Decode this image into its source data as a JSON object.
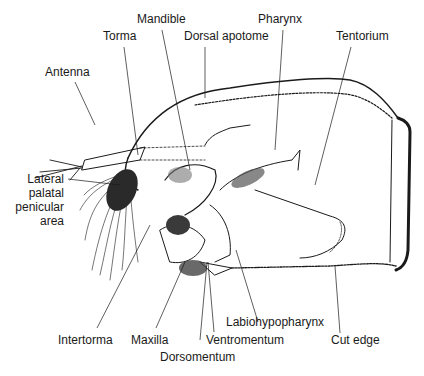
{
  "figure": {
    "ink_color": "#1a1a1a",
    "background": "#ffffff"
  },
  "labels": {
    "mandible": "Mandible",
    "pharynx": "Pharynx",
    "torma": "Torma",
    "dorsal_apotome": "Dorsal apotome",
    "tentorium": "Tentorium",
    "antenna": "Antenna",
    "lateral_palatal_1": "Lateral",
    "lateral_palatal_2": "palatal",
    "lateral_palatal_3": "penicular",
    "lateral_palatal_4": "area",
    "intertorma": "Intertorma",
    "maxilla": "Maxilla",
    "dorsomentum": "Dorsomentum",
    "ventromentum": "Ventromentum",
    "labiohypopharynx": "Labiohypopharynx",
    "cut_edge": "Cut edge"
  }
}
